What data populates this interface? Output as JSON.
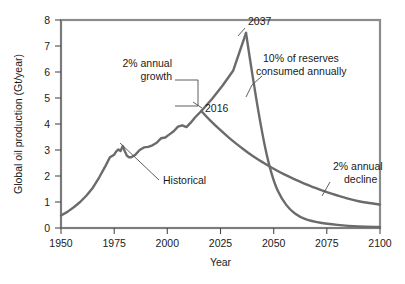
{
  "chart_data": {
    "type": "line",
    "title": "",
    "xlabel": "Year",
    "ylabel": "Global oil production (Gt/year)",
    "xlim": [
      1950,
      2100
    ],
    "ylim": [
      0,
      8
    ],
    "xticks": [
      1950,
      1975,
      2000,
      2025,
      2050,
      2075,
      2100
    ],
    "yticks": [
      0,
      1,
      2,
      3,
      4,
      5,
      6,
      7,
      8
    ],
    "grid": false,
    "legend": "none",
    "series": [
      {
        "name": "Historical",
        "x": [
          1950,
          1953,
          1956,
          1959,
          1962,
          1965,
          1968,
          1971,
          1973,
          1975,
          1976,
          1977,
          1978,
          1979,
          1980,
          1981,
          1982,
          1983,
          1985,
          1987,
          1989,
          1991,
          1993,
          1995,
          1997,
          1999,
          2001,
          2003,
          2005,
          2007,
          2009,
          2011,
          2013,
          2016
        ],
        "y": [
          0.48,
          0.62,
          0.8,
          1.0,
          1.25,
          1.55,
          1.95,
          2.4,
          2.72,
          2.82,
          2.95,
          3.02,
          2.96,
          3.15,
          2.95,
          2.78,
          2.72,
          2.72,
          2.82,
          3.0,
          3.1,
          3.12,
          3.18,
          3.28,
          3.45,
          3.48,
          3.6,
          3.72,
          3.9,
          3.95,
          3.88,
          4.05,
          4.25,
          4.5
        ]
      },
      {
        "name": "2% annual growth",
        "x": [
          2016,
          2021,
          2026,
          2031,
          2037
        ],
        "y": [
          4.5,
          4.96,
          5.48,
          6.06,
          7.5
        ]
      },
      {
        "name": "10% of reserves consumed annually",
        "x": [
          2037,
          2040,
          2043,
          2046,
          2049,
          2052,
          2056,
          2060,
          2065,
          2072,
          2080,
          2090,
          2100
        ],
        "y": [
          7.5,
          5.9,
          4.4,
          3.1,
          2.1,
          1.42,
          0.88,
          0.56,
          0.34,
          0.2,
          0.12,
          0.06,
          0.04
        ]
      },
      {
        "name": "2% annual decline",
        "x": [
          2016,
          2020,
          2025,
          2030,
          2035,
          2040,
          2045,
          2050,
          2055,
          2060,
          2065,
          2070,
          2075,
          2080,
          2085,
          2090,
          2095,
          2100
        ],
        "y": [
          4.5,
          4.15,
          3.76,
          3.4,
          3.08,
          2.78,
          2.52,
          2.28,
          2.06,
          1.87,
          1.69,
          1.53,
          1.38,
          1.25,
          1.13,
          1.03,
          0.96,
          0.9
        ]
      }
    ],
    "annotations": [
      {
        "id": "growth-label",
        "text": "2% annual",
        "line2": "growth"
      },
      {
        "id": "year-2016-label",
        "text": "2016"
      },
      {
        "id": "year-2037-label",
        "text": "2037"
      },
      {
        "id": "reserves-label",
        "text": "10% of reserves",
        "line2": "consumed annually"
      },
      {
        "id": "decline-label",
        "text": "2% annual",
        "line2": "decline"
      },
      {
        "id": "historical-label",
        "text": "Historical"
      }
    ]
  },
  "axis": {
    "y_title": "Global oil production (Gt/year)",
    "x_title": "Year",
    "xticks": [
      "1950",
      "1975",
      "2000",
      "2025",
      "2050",
      "2075",
      "2100"
    ],
    "yticks": [
      "0",
      "1",
      "2",
      "3",
      "4",
      "5",
      "6",
      "7",
      "8"
    ]
  },
  "labels": {
    "growth_line1": "2% annual",
    "growth_line2": "growth",
    "peak_year": "2037",
    "branch_year": "2016",
    "reserves_line1": "10% of reserves",
    "reserves_line2": "consumed annually",
    "decline_line1": "2% annual",
    "decline_line2": "decline",
    "historical": "Historical"
  },
  "colors": {
    "line": "#6b6b6b",
    "frame": "#8c8c8c",
    "text": "#1a1a1a",
    "background": "#ffffff"
  }
}
